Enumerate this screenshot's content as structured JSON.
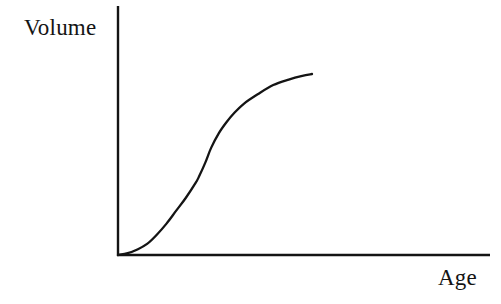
{
  "figure": {
    "background_color": "#ffffff",
    "ink_color": "#141414",
    "axis_color": "#141414",
    "curve_color": "#141414"
  },
  "labels": {
    "y_axis": "Volume",
    "x_axis": "Age"
  },
  "chart_data": {
    "type": "line",
    "title": "",
    "subtitle": "",
    "xlabel": "Age",
    "ylabel": "Volume",
    "legend": [],
    "legend_position": "none",
    "grid": false,
    "tick_labels_x": [],
    "tick_labels_y": [],
    "axis_style": "two-axis-L-frame-no-ticks",
    "xlim": [
      0,
      1
    ],
    "ylim": [
      0,
      1
    ],
    "series": [
      {
        "name": "Volume",
        "x": [
          0.0,
          0.05,
          0.1,
          0.15,
          0.2,
          0.25,
          0.3,
          0.35,
          0.4,
          0.42,
          0.45,
          0.48,
          0.52,
          0.56,
          0.6,
          0.65,
          0.72,
          0.8,
          0.88,
          0.95,
          1.0
        ],
        "y": [
          0.0,
          0.01,
          0.03,
          0.06,
          0.11,
          0.17,
          0.24,
          0.31,
          0.39,
          0.43,
          0.5,
          0.58,
          0.66,
          0.72,
          0.77,
          0.82,
          0.87,
          0.92,
          0.95,
          0.97,
          0.98
        ]
      }
    ],
    "curve_geometry": {
      "origin_px": [
        118,
        255
      ],
      "end_px": [
        312,
        74
      ],
      "inflection_px": [
        199,
        158
      ],
      "x_axis_end_px": [
        490,
        255
      ],
      "y_axis_top_px": [
        118,
        6
      ]
    }
  }
}
